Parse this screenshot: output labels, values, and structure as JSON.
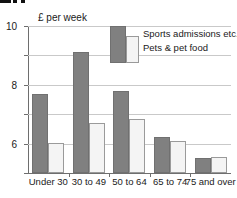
{
  "figure_sliver": {
    "note": "cropped heading glyph tops"
  },
  "chart_data": {
    "type": "bar",
    "title": "",
    "subtitle": "",
    "xlabel": "",
    "ylabel": "£ per week",
    "axis_title": "£ per week",
    "categories": [
      "Under 30",
      "30 to 49",
      "50 to 64",
      "65 to 74",
      "75 and over"
    ],
    "series": [
      {
        "name": "Sports admissions etc.",
        "color": "#808080",
        "values": [
          5.4,
          8.2,
          5.6,
          2.45,
          1.0
        ]
      },
      {
        "name": "Pets & pet food",
        "color": "#f4f4f4",
        "values": [
          2.05,
          3.4,
          3.7,
          2.15,
          1.1
        ]
      }
    ],
    "ylim": [
      0,
      10
    ],
    "yticks": [
      0,
      2,
      4,
      6,
      8,
      10
    ],
    "ytick_labels": [
      "0",
      "2",
      "4",
      "6",
      "8",
      "10"
    ],
    "grid": true,
    "grid_axis": "y",
    "legend_position": "upper-center",
    "legend": [
      "Sports admissions etc.",
      "Pets & pet food"
    ]
  },
  "legend": {
    "entries": [
      {
        "label": "Sports admissions etc."
      },
      {
        "label": "Pets & pet food"
      }
    ]
  },
  "colors": {
    "series1": "#808080",
    "series2": "#f4f4f4",
    "gridline": "#c9c9c9",
    "axis": "#6e6e6e",
    "text": "#1a1a1a",
    "background": "#ffffff"
  }
}
